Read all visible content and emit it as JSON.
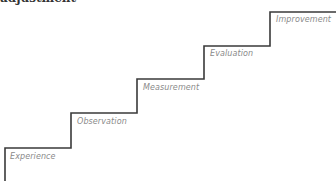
{
  "heading": {
    "text": "adjustment"
  },
  "diagram": {
    "type": "staircase",
    "line_color": "#3a3a3a",
    "label_color": "#8a8a8a",
    "steps": [
      {
        "label": "Experience"
      },
      {
        "label": "Observation"
      },
      {
        "label": "Measurement"
      },
      {
        "label": "Evaluation"
      },
      {
        "label": "Improvement"
      }
    ]
  }
}
